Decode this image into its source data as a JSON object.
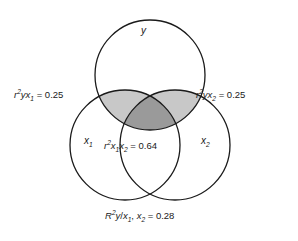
{
  "figure": {
    "type": "venn-diagram",
    "background_color": "#ffffff",
    "stroke_color": "#1a1a1a",
    "light_shade_color": "#c8c8c8",
    "dark_shade_color": "#9a9a9a",
    "text_color": "#1a1a1a"
  },
  "sets": {
    "top": {
      "label": "y",
      "name": "y-circle",
      "cx": 150,
      "cy": 75,
      "r": 55
    },
    "bottom_left": {
      "label_base": "x",
      "label_sub": "1",
      "name": "x1-circle",
      "cx": 125,
      "cy": 145,
      "r": 55
    },
    "bottom_right": {
      "label_base": "x",
      "label_sub": "2",
      "name": "x2-circle",
      "cx": 175,
      "cy": 145,
      "r": 55
    }
  },
  "annotations": {
    "left": {
      "var1": "r",
      "sup1": "2",
      "var2": "y",
      "var3": "x",
      "sub3": "1",
      "equals": " = 0.25",
      "value": 0.25,
      "full_text": "r2yx1 = 0.25"
    },
    "right": {
      "var1": "r",
      "sup1": "2",
      "var2": "y",
      "var3": "x",
      "sub3": "2",
      "equals": " = 0.25",
      "value": 0.25,
      "full_text": "r2yx2 = 0.25"
    },
    "center": {
      "var1": "r",
      "sup1": "2",
      "var2": "x",
      "sub2": "1",
      "var3": "x",
      "sub3": "2",
      "equals": " = 0.64",
      "value": 0.64,
      "full_text": "r2x1x2 = 0.64"
    },
    "bottom": {
      "var1": "R",
      "sup1": "2",
      "var2": "y",
      "slash": "/",
      "var3": "x",
      "sub3": "1",
      "comma": ", ",
      "var4": "x",
      "sub4": "2",
      "equals": " = 0.28",
      "value": 0.28,
      "full_text": "R2y/x1, x2 = 0.28"
    }
  }
}
